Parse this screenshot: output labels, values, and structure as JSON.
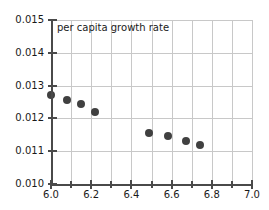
{
  "chart_data": {
    "type": "scatter",
    "title": "per capita growth rate",
    "xlabel": "",
    "ylabel": "",
    "xlim": [
      6.0,
      7.0
    ],
    "ylim": [
      0.01,
      0.015
    ],
    "grid": true,
    "legend": null,
    "x_ticks": [
      {
        "value": 6.0,
        "label": "6.0",
        "major": true
      },
      {
        "value": 6.1,
        "label": "",
        "major": false
      },
      {
        "value": 6.2,
        "label": "6.2",
        "major": true
      },
      {
        "value": 6.3,
        "label": "",
        "major": false
      },
      {
        "value": 6.4,
        "label": "6.4",
        "major": true
      },
      {
        "value": 6.5,
        "label": "",
        "major": false
      },
      {
        "value": 6.6,
        "label": "6.6",
        "major": true
      },
      {
        "value": 6.7,
        "label": "",
        "major": false
      },
      {
        "value": 6.8,
        "label": "6.8",
        "major": true
      },
      {
        "value": 6.9,
        "label": "",
        "major": false
      },
      {
        "value": 7.0,
        "label": "7.0",
        "major": true
      }
    ],
    "y_ticks": [
      {
        "value": 0.01,
        "label": "0.010"
      },
      {
        "value": 0.011,
        "label": "0.011"
      },
      {
        "value": 0.012,
        "label": "0.012"
      },
      {
        "value": 0.013,
        "label": "0.013"
      },
      {
        "value": 0.014,
        "label": "0.014"
      },
      {
        "value": 0.015,
        "label": "0.015"
      }
    ],
    "gridlines_x": [
      6.1,
      6.2,
      6.3,
      6.4,
      6.5,
      6.6,
      6.7,
      6.8,
      6.9,
      7.0
    ],
    "gridlines_y": [
      0.011,
      0.012,
      0.013,
      0.014,
      0.015
    ],
    "marker_color": "#404040",
    "marker_size": 8,
    "x": [
      6.0,
      6.08,
      6.15,
      6.22,
      6.49,
      6.58,
      6.67,
      6.74
    ],
    "y": [
      0.01271,
      0.01256,
      0.01244,
      0.0122,
      0.01156,
      0.01146,
      0.01131,
      0.01119
    ],
    "points": [
      {
        "x": 6.0,
        "y": 0.01271
      },
      {
        "x": 6.08,
        "y": 0.01256
      },
      {
        "x": 6.15,
        "y": 0.01244
      },
      {
        "x": 6.22,
        "y": 0.0122
      },
      {
        "x": 6.49,
        "y": 0.01156
      },
      {
        "x": 6.58,
        "y": 0.01146
      },
      {
        "x": 6.67,
        "y": 0.01131
      },
      {
        "x": 6.74,
        "y": 0.01119
      }
    ]
  }
}
